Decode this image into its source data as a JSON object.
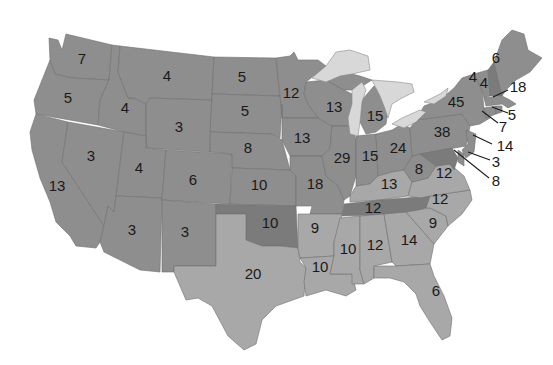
{
  "map": {
    "title": "Electoral votes by state",
    "colors": {
      "background": "#ffffff",
      "base": "#8e8e8e",
      "light": "#a8a8a8",
      "dark": "#7b7b7b",
      "lake": "#d8d8d8",
      "border": "#6f6f6f",
      "text": "#1a1a1a"
    },
    "states": {
      "WA": {
        "votes": "7"
      },
      "OR": {
        "votes": "5"
      },
      "CA": {
        "votes": "13"
      },
      "ID": {
        "votes": "4"
      },
      "NV": {
        "votes": "3"
      },
      "MT": {
        "votes": "4"
      },
      "WY": {
        "votes": "3"
      },
      "UT": {
        "votes": "4"
      },
      "AZ": {
        "votes": "3"
      },
      "CO": {
        "votes": "6"
      },
      "NM": {
        "votes": "3"
      },
      "ND": {
        "votes": "5"
      },
      "SD": {
        "votes": "5"
      },
      "NE": {
        "votes": "8"
      },
      "KS": {
        "votes": "10"
      },
      "OK": {
        "votes": "10"
      },
      "TX": {
        "votes": "20"
      },
      "MN": {
        "votes": "12"
      },
      "IA": {
        "votes": "13"
      },
      "MO": {
        "votes": "18"
      },
      "AR": {
        "votes": "9"
      },
      "LA": {
        "votes": "10"
      },
      "WI": {
        "votes": "13"
      },
      "IL": {
        "votes": "29"
      },
      "MI": {
        "votes": "15"
      },
      "IN": {
        "votes": "15"
      },
      "OH": {
        "votes": "24"
      },
      "KY": {
        "votes": "13"
      },
      "TN": {
        "votes": "12"
      },
      "MS": {
        "votes": "10"
      },
      "AL": {
        "votes": "12"
      },
      "GA": {
        "votes": "14"
      },
      "FL": {
        "votes": "6"
      },
      "SC": {
        "votes": "9"
      },
      "NC": {
        "votes": "12"
      },
      "VA": {
        "votes": "12"
      },
      "WV": {
        "votes": "8"
      },
      "PA": {
        "votes": "38"
      },
      "NY": {
        "votes": "45"
      },
      "VT": {
        "votes": "4"
      },
      "NH": {
        "votes": "4"
      },
      "ME": {
        "votes": "6"
      },
      "MA": {
        "votes": "18"
      },
      "RI": {
        "votes": "5"
      },
      "CT": {
        "votes": "7"
      },
      "NJ": {
        "votes": "14"
      },
      "DE": {
        "votes": "3"
      },
      "MD": {
        "votes": "8"
      }
    }
  }
}
